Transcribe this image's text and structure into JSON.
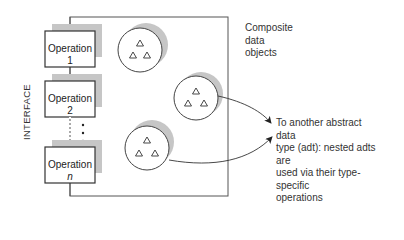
{
  "diagram": {
    "interface_label": "INTERFACE",
    "operations": [
      {
        "label": "Operation 1",
        "suffix": ""
      },
      {
        "label": "Operation 2",
        "suffix": ""
      },
      {
        "label": "Operation ",
        "suffix": "n"
      }
    ],
    "ellipsis": "⋮",
    "composite_label_lines": [
      "Composite",
      "data",
      "objects"
    ],
    "adt_annotation_lines": [
      "To another abstract data",
      "type (adt): nested adts are",
      "used via their type-specific",
      "operations"
    ],
    "colors": {
      "line": "#333333",
      "shadow": "#c6c6c6",
      "fill": "#ffffff",
      "text": "#333333"
    }
  }
}
